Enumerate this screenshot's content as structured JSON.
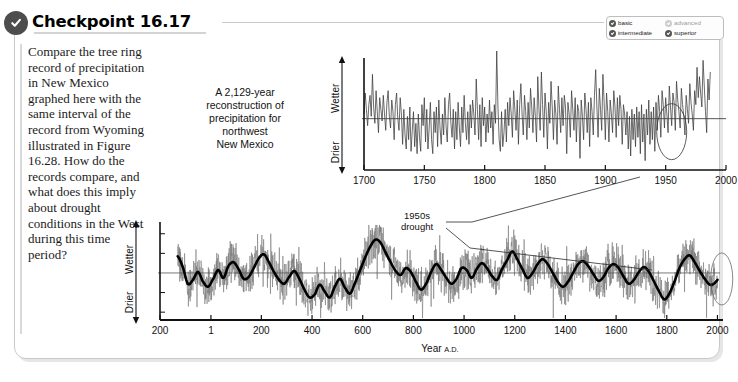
{
  "header": {
    "title": "Checkpoint 16.17",
    "check_icon": "check-circle-icon"
  },
  "badges": [
    {
      "label": "basic",
      "state": "on"
    },
    {
      "label": "advanced",
      "state": "off"
    },
    {
      "label": "intermediate",
      "state": "on"
    },
    {
      "label": "superior",
      "state": "on"
    }
  ],
  "question": {
    "text": "Compare the tree ring record of precipitation in New Mexico graphed here with the same interval of the record from Wyoming illustrated in Figure 16.28. How do the records compare, and what does this imply about drought conditions in the West during this time period?"
  },
  "caption": {
    "line1": "A 2,129-year",
    "line2": "reconstruction of",
    "line3": "precipitation for",
    "line4": "northwest",
    "line5": "New Mexico"
  },
  "annotations": {
    "drought_line1": "1950s",
    "drought_line2": "drought"
  },
  "chart_data": [
    {
      "id": "inset-chart",
      "type": "line",
      "title": "",
      "xlabel": "",
      "ylabel": "Wetter / Drier",
      "y_axis_up_label": "Wetter",
      "y_axis_down_label": "Drier",
      "xlim": [
        1700,
        2000
      ],
      "xticks": [
        1700,
        1750,
        1800,
        1850,
        1900,
        1950,
        2000
      ],
      "xticklabels": [
        "1700",
        "1750",
        "1800",
        "1850",
        "1900",
        "1950",
        "2000"
      ],
      "ylim": [
        -2.2,
        2.6
      ],
      "grid": false,
      "baseline": 0,
      "series": [
        {
          "name": "annual precipitation anomaly",
          "color": "#3a3a3a",
          "x_start": 1700,
          "x_step": 1,
          "values": [
            0.2,
            1.1,
            0.4,
            -0.3,
            0.6,
            1.0,
            0.1,
            1.9,
            0.5,
            -0.2,
            1.2,
            0.3,
            -0.6,
            0.9,
            0.4,
            -0.1,
            1.0,
            0.2,
            -0.5,
            0.7,
            1.2,
            0.1,
            -0.4,
            0.8,
            0.3,
            -0.9,
            0.6,
            1.1,
            0.0,
            -0.5,
            0.9,
            0.2,
            -1.1,
            0.4,
            -0.7,
            -1.3,
            0.1,
            -0.9,
            0.5,
            -1.4,
            -0.5,
            0.3,
            -1.2,
            -0.2,
            -1.5,
            0.2,
            -0.8,
            -1.4,
            0.6,
            -0.3,
            0.9,
            -1.0,
            0.4,
            -1.3,
            -0.4,
            0.7,
            -0.9,
            -1.5,
            0.3,
            -0.6,
            0.5,
            -1.2,
            0.8,
            -0.4,
            -1.1,
            0.2,
            -0.7,
            0.9,
            -0.3,
            -1.0,
            0.6,
            1.1,
            -0.2,
            -0.8,
            0.4,
            -1.3,
            0.3,
            -0.9,
            0.7,
            -0.4,
            -1.2,
            0.5,
            -0.6,
            1.0,
            -0.2,
            -0.9,
            0.3,
            -1.1,
            0.6,
            -0.4,
            0.8,
            0.2,
            -0.7,
            1.7,
            0.4,
            -0.9,
            0.6,
            -1.2,
            0.9,
            -0.3,
            0.5,
            -1.0,
            0.2,
            -0.6,
            0.8,
            -0.4,
            0.3,
            -1.1,
            0.6,
            -0.2,
            2.9,
            0.5,
            -0.9,
            -1.4,
            0.3,
            -1.2,
            -0.6,
            0.4,
            -1.0,
            0.7,
            -0.3,
            0.9,
            0.2,
            -0.8,
            1.2,
            0.4,
            -0.5,
            0.8,
            -1.1,
            0.6,
            1.5,
            0.2,
            -0.7,
            1.0,
            0.3,
            -0.9,
            0.7,
            -0.4,
            1.3,
            0.5,
            -0.6,
            0.9,
            0.1,
            -1.0,
            1.8,
            0.4,
            -0.5,
            2.0,
            0.6,
            -0.8,
            1.1,
            0.3,
            -1.3,
            0.7,
            -0.2,
            1.6,
            0.5,
            -0.9,
            0.8,
            0.2,
            -1.1,
            1.4,
            0.4,
            -0.6,
            0.9,
            -0.3,
            1.0,
            0.5,
            -1.5,
            0.7,
            0.2,
            -0.8,
            1.2,
            0.4,
            -0.5,
            0.9,
            -1.0,
            0.6,
            0.3,
            -1.7,
            0.8,
            0.1,
            -0.9,
            1.1,
            0.4,
            -0.6,
            0.7,
            -1.2,
            0.9,
            0.3,
            -0.7,
            1.0,
            2.1,
            0.5,
            -0.8,
            1.3,
            0.4,
            -0.5,
            1.9,
            0.7,
            -0.9,
            1.1,
            0.3,
            -1.0,
            0.8,
            0.2,
            -0.6,
            1.2,
            0.5,
            -0.8,
            0.9,
            -0.3,
            1.0,
            0.4,
            -1.1,
            0.6,
            0.2,
            -0.7,
            0.3,
            -1.3,
            0.1,
            -1.6,
            0.4,
            -0.9,
            0.2,
            -1.2,
            0.5,
            -0.8,
            0.3,
            -1.5,
            0.6,
            -1.0,
            0.2,
            -1.8,
            0.4,
            -0.7,
            0.8,
            -1.1,
            0.3,
            -0.9,
            0.5,
            -1.4,
            0.7,
            -0.5,
            1.0,
            0.3,
            -0.8,
            1.2,
            0.6,
            -0.4,
            0.9,
            0.2,
            -0.6,
            1.4,
            0.5,
            -0.3,
            1.1,
            0.7,
            -0.5,
            1.6,
            0.8,
            0.3,
            -0.4,
            1.3,
            0.6,
            0.1,
            -0.7,
            1.0,
            0.4,
            -0.2,
            1.5,
            0.7,
            0.2,
            -0.5,
            1.2,
            0.6,
            2.2,
            0.9,
            1.8,
            1.1,
            0.5,
            2.5,
            1.4,
            0.3,
            -0.6,
            1.7,
            0.8,
            2.0
          ]
        }
      ],
      "highlight_ellipse": {
        "center_year": 1955,
        "label": "1950s drought"
      }
    },
    {
      "id": "main-chart",
      "type": "line",
      "title": "",
      "xlabel": "Year A.D.",
      "ylabel": "Wetter / Drier",
      "y_axis_up_label": "Wetter",
      "y_axis_down_label": "Drier",
      "xlim": [
        -200,
        2010
      ],
      "xticks": [
        -200,
        1,
        200,
        400,
        600,
        800,
        1000,
        1200,
        1400,
        1600,
        1800,
        2000
      ],
      "xticklabels": [
        "200",
        "1",
        "200",
        "400",
        "600",
        "800",
        "1000",
        "1200",
        "1400",
        "1600",
        "1800",
        "2000"
      ],
      "ylim": [
        -2.4,
        2.6
      ],
      "grid": false,
      "baseline": 0,
      "series": [
        {
          "name": "annual reconstruction",
          "color": "#7a7a7a",
          "linewidth": 0.6
        },
        {
          "name": "smoothed (decadal) trend",
          "color": "#000000",
          "linewidth": 2.6,
          "x_start": -130,
          "x_step": 20,
          "values": [
            0.85,
            0.3,
            -0.55,
            -0.35,
            0.05,
            -0.45,
            -0.7,
            -0.3,
            0.15,
            -0.25,
            0.35,
            0.55,
            0.2,
            -0.3,
            -0.2,
            0.25,
            0.75,
            0.95,
            0.55,
            0.05,
            -0.35,
            -0.55,
            -0.2,
            0.1,
            -0.3,
            -0.85,
            -1.25,
            -1.1,
            -0.6,
            -0.95,
            -1.25,
            -0.7,
            -0.3,
            -0.75,
            -1.05,
            -0.5,
            0.15,
            0.8,
            1.35,
            1.7,
            1.55,
            1.05,
            0.55,
            0.1,
            -0.1,
            0.25,
            0.05,
            -0.45,
            -0.85,
            -0.55,
            0.05,
            0.45,
            0.15,
            -0.25,
            -0.55,
            -0.3,
            0.25,
            0.15,
            -0.25,
            0.2,
            0.5,
            0.25,
            -0.15,
            -0.35,
            0.2,
            0.65,
            1.1,
            0.7,
            0.2,
            -0.25,
            0.0,
            0.45,
            0.7,
            0.45,
            0.0,
            -0.45,
            -0.7,
            -0.45,
            0.0,
            0.45,
            0.6,
            0.35,
            -0.05,
            -0.4,
            -0.2,
            0.25,
            0.45,
            0.25,
            -0.2,
            -0.55,
            -0.35,
            0.05,
            0.3,
            0.05,
            -0.45,
            -0.95,
            -1.35,
            -1.05,
            -0.45,
            0.25,
            0.7,
            0.9,
            0.55,
            0.1,
            -0.3,
            -0.6,
            -0.5,
            -0.15,
            0.35,
            0.8,
            1.0,
            0.75,
            0.55,
            0.6,
            0.55,
            0.25,
            -0.3,
            -0.75,
            -0.4,
            0.45,
            1.3
          ]
        }
      ],
      "highlight_ellipse": {
        "center_year": 1930,
        "label": "1950s drought"
      }
    }
  ]
}
